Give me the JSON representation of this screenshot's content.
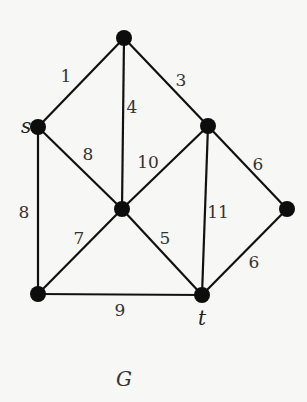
{
  "diagram": {
    "type": "weighted-undirected-graph",
    "caption": "G",
    "nodes": [
      {
        "id": "top",
        "label": "",
        "x": 124,
        "y": 38
      },
      {
        "id": "s",
        "label": "s",
        "x": 38,
        "y": 127
      },
      {
        "id": "u",
        "label": "",
        "x": 208,
        "y": 126
      },
      {
        "id": "c",
        "label": "",
        "x": 122,
        "y": 209
      },
      {
        "id": "r",
        "label": "",
        "x": 287,
        "y": 209
      },
      {
        "id": "bl",
        "label": "",
        "x": 38,
        "y": 294
      },
      {
        "id": "t",
        "label": "t",
        "x": 202,
        "y": 295
      }
    ],
    "edges": [
      {
        "from": "top",
        "to": "s",
        "weight": "1",
        "lx": 66,
        "ly": 82
      },
      {
        "from": "top",
        "to": "c",
        "weight": "4",
        "lx": 132,
        "ly": 113
      },
      {
        "from": "top",
        "to": "u",
        "weight": "3",
        "lx": 181,
        "ly": 86
      },
      {
        "from": "s",
        "to": "c",
        "weight": "8",
        "lx": 88,
        "ly": 160
      },
      {
        "from": "s",
        "to": "bl",
        "weight": "8",
        "lx": 24,
        "ly": 218
      },
      {
        "from": "u",
        "to": "c",
        "weight": "10",
        "lx": 148,
        "ly": 168
      },
      {
        "from": "u",
        "to": "t",
        "weight": "11",
        "lx": 218,
        "ly": 218
      },
      {
        "from": "u",
        "to": "r",
        "weight": "6",
        "lx": 258,
        "ly": 170
      },
      {
        "from": "c",
        "to": "bl",
        "weight": "7",
        "lx": 79,
        "ly": 244
      },
      {
        "from": "c",
        "to": "t",
        "weight": "5",
        "lx": 165,
        "ly": 244
      },
      {
        "from": "r",
        "to": "t",
        "weight": "6",
        "lx": 254,
        "ly": 268
      },
      {
        "from": "bl",
        "to": "t",
        "weight": "9",
        "lx": 120,
        "ly": 316
      }
    ],
    "node_labels": [
      {
        "id": "s",
        "text": "s",
        "x": 21,
        "y": 133
      },
      {
        "id": "t",
        "text": "t",
        "x": 198,
        "y": 325
      }
    ],
    "caption_pos": {
      "x": 116,
      "y": 386
    },
    "colors": {
      "edge": "#111111",
      "node": "#0d0d0d",
      "background": "#f7f7f5"
    }
  }
}
